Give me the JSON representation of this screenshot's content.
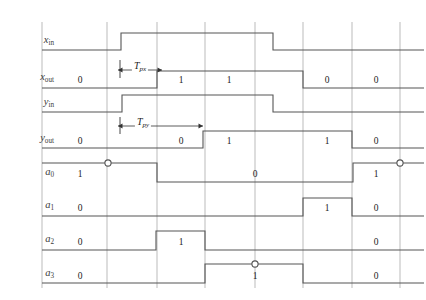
{
  "figure": {
    "type": "timing-diagram",
    "title": "",
    "background": "#ffffff",
    "signal_color": "#555555",
    "grid_color": "#aaaaaa",
    "width": 426,
    "height": 300
  },
  "geometry": {
    "grid_x": [
      42,
      107,
      157,
      205,
      255,
      303,
      352,
      400
    ],
    "grid_top": 22,
    "grid_bottom": 288,
    "axis_right": 424
  },
  "rows": [
    {
      "name": "x-in",
      "label_base": "x",
      "label_sub": "in",
      "label_sub_italic": false,
      "label_x": 54,
      "label_y": 40,
      "low_y": 50,
      "high_y": 33,
      "segments": [
        {
          "from": 42,
          "to": 121,
          "level": "low",
          "value": ""
        },
        {
          "from": 121,
          "to": 273,
          "level": "high",
          "value": ""
        },
        {
          "from": 273,
          "to": 424,
          "level": "low",
          "value": ""
        }
      ],
      "markers": []
    },
    {
      "name": "x-out",
      "label_base": "x",
      "label_sub": "out",
      "label_sub_italic": false,
      "label_x": 54,
      "label_y": 77,
      "low_y": 88,
      "high_y": 71,
      "segments": [
        {
          "from": 42,
          "to": 157,
          "level": "low",
          "value": "0",
          "value_x": 80,
          "value_y": 80
        },
        {
          "from": 157,
          "to": 303,
          "level": "high",
          "value": "1",
          "value_x": 181,
          "value_y": 80
        },
        {
          "from": 157,
          "to": 303,
          "level": "high",
          "value": "1",
          "value_x": 229,
          "value_y": 80
        },
        {
          "from": 303,
          "to": 424,
          "level": "low",
          "value": "0",
          "value_x": 327,
          "value_y": 80
        },
        {
          "from": 303,
          "to": 424,
          "level": "low",
          "value": "0",
          "value_x": 376,
          "value_y": 80
        }
      ],
      "markers": []
    },
    {
      "name": "y-in",
      "label_base": "y",
      "label_sub": "in",
      "label_sub_italic": false,
      "label_x": 54,
      "label_y": 102,
      "low_y": 112,
      "high_y": 95,
      "segments": [
        {
          "from": 42,
          "to": 122,
          "level": "low",
          "value": ""
        },
        {
          "from": 122,
          "to": 273,
          "level": "high",
          "value": ""
        },
        {
          "from": 273,
          "to": 424,
          "level": "low",
          "value": ""
        }
      ],
      "markers": []
    },
    {
      "name": "y-out",
      "label_base": "y",
      "label_sub": "out",
      "label_sub_italic": false,
      "label_x": 54,
      "label_y": 138,
      "low_y": 148,
      "high_y": 131,
      "segments": [
        {
          "from": 42,
          "to": 203,
          "level": "low",
          "value": "0",
          "value_x": 80,
          "value_y": 141
        },
        {
          "from": 42,
          "to": 203,
          "level": "low",
          "value": "0",
          "value_x": 181,
          "value_y": 141
        },
        {
          "from": 203,
          "to": 352,
          "level": "high",
          "value": "1",
          "value_x": 229,
          "value_y": 141
        },
        {
          "from": 203,
          "to": 352,
          "level": "high",
          "value": "1",
          "value_x": 327,
          "value_y": 141
        },
        {
          "from": 352,
          "to": 424,
          "level": "low",
          "value": "0",
          "value_x": 376,
          "value_y": 141
        }
      ],
      "markers": []
    },
    {
      "name": "a0",
      "label_base": "a",
      "label_sub": "0",
      "label_sub_italic": false,
      "label_x": 54,
      "label_y": 172,
      "low_y": 182,
      "high_y": 163,
      "segments": [
        {
          "from": 42,
          "to": 157,
          "level": "high",
          "value": "1",
          "value_x": 80,
          "value_y": 174
        },
        {
          "from": 157,
          "to": 353,
          "level": "low",
          "value": "0",
          "value_x": 255,
          "value_y": 174
        },
        {
          "from": 353,
          "to": 424,
          "level": "high",
          "value": "1",
          "value_x": 376,
          "value_y": 174
        }
      ],
      "markers": [
        {
          "x": 108,
          "y": 163
        },
        {
          "x": 400,
          "y": 163
        }
      ]
    },
    {
      "name": "a1",
      "label_base": "a",
      "label_sub": "1",
      "label_sub_italic": false,
      "label_x": 54,
      "label_y": 205,
      "low_y": 216,
      "high_y": 198,
      "segments": [
        {
          "from": 42,
          "to": 303,
          "level": "low",
          "value": "0",
          "value_x": 80,
          "value_y": 208
        },
        {
          "from": 303,
          "to": 352,
          "level": "high",
          "value": "1",
          "value_x": 327,
          "value_y": 208
        },
        {
          "from": 352,
          "to": 424,
          "level": "low",
          "value": "0",
          "value_x": 376,
          "value_y": 208
        }
      ],
      "markers": []
    },
    {
      "name": "a2",
      "label_base": "a",
      "label_sub": "2",
      "label_sub_italic": false,
      "label_x": 54,
      "label_y": 239,
      "low_y": 250,
      "high_y": 231,
      "segments": [
        {
          "from": 42,
          "to": 156,
          "level": "low",
          "value": "0",
          "value_x": 80,
          "value_y": 242
        },
        {
          "from": 156,
          "to": 205,
          "level": "high",
          "value": "1",
          "value_x": 181,
          "value_y": 242
        },
        {
          "from": 205,
          "to": 424,
          "level": "low",
          "value": "0",
          "value_x": 376,
          "value_y": 242
        }
      ],
      "markers": []
    },
    {
      "name": "a3",
      "label_base": "a",
      "label_sub": "3",
      "label_sub_italic": false,
      "label_x": 54,
      "label_y": 273,
      "low_y": 283,
      "high_y": 264,
      "segments": [
        {
          "from": 42,
          "to": 205,
          "level": "low",
          "value": "0",
          "value_x": 80,
          "value_y": 276
        },
        {
          "from": 205,
          "to": 303,
          "level": "high",
          "value": "1",
          "value_x": 255,
          "value_y": 276
        },
        {
          "from": 303,
          "to": 424,
          "level": "low",
          "value": "0",
          "value_x": 376,
          "value_y": 276
        }
      ],
      "markers": [
        {
          "x": 255,
          "y": 264
        }
      ]
    }
  ],
  "annotations": [
    {
      "name": "tpx",
      "label_base": "T",
      "label_sub": "px",
      "label_x": 140,
      "label_y": 66,
      "arrow_y": 70,
      "from_x": 118,
      "to_x": 162,
      "tick_top": 60,
      "tick_bottom": 78,
      "tick_x": 120
    },
    {
      "name": "tpy",
      "label_base": "T",
      "label_sub": "py",
      "label_x": 143,
      "label_y": 122,
      "arrow_y": 126,
      "from_x": 118,
      "to_x": 203,
      "tick_top": 117,
      "tick_bottom": 134,
      "tick_x": 120
    }
  ]
}
